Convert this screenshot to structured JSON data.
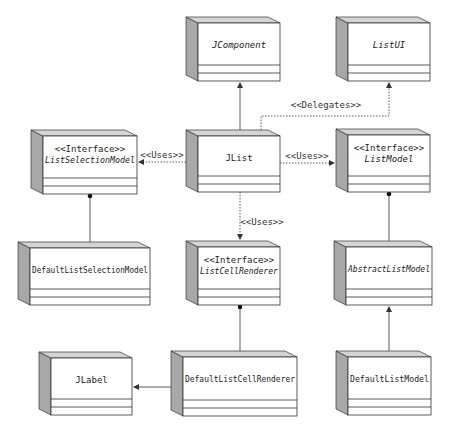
{
  "diagram": {
    "type": "UML class diagram",
    "colors": {
      "side_face": "#a8a8a8",
      "top_face": "#d4d4d4",
      "front_face": "#ffffff",
      "line": "#333333"
    },
    "classes": [
      {
        "id": "jcomponent",
        "stereotype": "",
        "name": "JComponent",
        "italic": true
      },
      {
        "id": "listui",
        "stereotype": "",
        "name": "ListUI",
        "italic": true
      },
      {
        "id": "listselectionmodel",
        "stereotype": "<<Interface>>",
        "name": "ListSelectionModel",
        "italic": true
      },
      {
        "id": "jlist",
        "stereotype": "",
        "name": "JList",
        "italic": false
      },
      {
        "id": "listmodel",
        "stereotype": "<<Interface>>",
        "name": "ListModel",
        "italic": true
      },
      {
        "id": "defaultlistselectionmodel",
        "stereotype": "",
        "name": "DefaultListSelectionModel",
        "italic": false
      },
      {
        "id": "listcellrenderer",
        "stereotype": "<<Interface>>",
        "name": "ListCellRenderer",
        "italic": true
      },
      {
        "id": "abstractlistmodel",
        "stereotype": "",
        "name": "AbstractListModel",
        "italic": true
      },
      {
        "id": "jlabel",
        "stereotype": "",
        "name": "JLabel",
        "italic": false
      },
      {
        "id": "defaultlistcellrenderer",
        "stereotype": "",
        "name": "DefaultListCellRenderer",
        "italic": false
      },
      {
        "id": "defaultlistmodel",
        "stereotype": "",
        "name": "DefaultListModel",
        "italic": false
      }
    ],
    "relations": [
      {
        "from": "jlist",
        "to": "jcomponent",
        "kind": "inheritance",
        "label": ""
      },
      {
        "from": "jlist",
        "to": "listui",
        "kind": "dependency",
        "label": "<<Delegates>>"
      },
      {
        "from": "jlist",
        "to": "listselectionmodel",
        "kind": "dependency",
        "label": "<<Uses>>"
      },
      {
        "from": "jlist",
        "to": "listmodel",
        "kind": "dependency",
        "label": "<<Uses>>"
      },
      {
        "from": "jlist",
        "to": "listcellrenderer",
        "kind": "dependency",
        "label": "<<Uses>>"
      },
      {
        "from": "defaultlistselectionmodel",
        "to": "listselectionmodel",
        "kind": "realization",
        "label": ""
      },
      {
        "from": "abstractlistmodel",
        "to": "listmodel",
        "kind": "realization",
        "label": ""
      },
      {
        "from": "defaultlistcellrenderer",
        "to": "listcellrenderer",
        "kind": "realization",
        "label": ""
      },
      {
        "from": "defaultlistmodel",
        "to": "abstractlistmodel",
        "kind": "inheritance",
        "label": ""
      },
      {
        "from": "defaultlistcellrenderer",
        "to": "jlabel",
        "kind": "inheritance",
        "label": ""
      }
    ]
  }
}
